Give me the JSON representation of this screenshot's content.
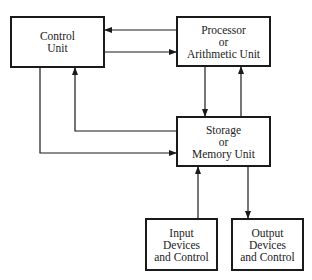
{
  "diagram": {
    "type": "block-diagram",
    "colors": {
      "line": "#1a1a1a",
      "text": "#222222",
      "background": "#ffffff"
    },
    "nodes": [
      {
        "id": "control",
        "lines": [
          "Control",
          "Unit"
        ],
        "x": 10,
        "y": 16,
        "w": 95,
        "h": 52
      },
      {
        "id": "processor",
        "lines": [
          "Processor",
          "or",
          "Arithmetic Unit"
        ],
        "x": 176,
        "y": 16,
        "w": 95,
        "h": 51
      },
      {
        "id": "storage",
        "lines": [
          "Storage",
          "or",
          "Memory Unit"
        ],
        "x": 176,
        "y": 116,
        "w": 95,
        "h": 51
      },
      {
        "id": "input",
        "lines": [
          "Input",
          "Devices",
          "and Control"
        ],
        "x": 145,
        "y": 218,
        "w": 73,
        "h": 53
      },
      {
        "id": "output",
        "lines": [
          "Output",
          "Devices",
          "and Control"
        ],
        "x": 231,
        "y": 218,
        "w": 73,
        "h": 53
      }
    ],
    "edges": [
      {
        "from": "processor",
        "to": "control",
        "points": [
          [
            176,
            30
          ],
          [
            105,
            30
          ]
        ]
      },
      {
        "from": "control",
        "to": "processor",
        "points": [
          [
            105,
            52
          ],
          [
            176,
            52
          ]
        ]
      },
      {
        "from": "processor",
        "to": "storage",
        "points": [
          [
            205,
            67
          ],
          [
            205,
            116
          ]
        ]
      },
      {
        "from": "storage",
        "to": "processor",
        "points": [
          [
            241,
            116
          ],
          [
            241,
            67
          ]
        ]
      },
      {
        "from": "storage",
        "to": "control",
        "points": [
          [
            176,
            131
          ],
          [
            75,
            131
          ],
          [
            75,
            68
          ]
        ]
      },
      {
        "from": "control",
        "to": "storage",
        "points": [
          [
            40,
            68
          ],
          [
            40,
            153
          ],
          [
            176,
            153
          ]
        ]
      },
      {
        "from": "input",
        "to": "storage",
        "points": [
          [
            198,
            218
          ],
          [
            198,
            167
          ]
        ]
      },
      {
        "from": "storage",
        "to": "output",
        "points": [
          [
            248,
            167
          ],
          [
            248,
            218
          ]
        ]
      }
    ]
  }
}
